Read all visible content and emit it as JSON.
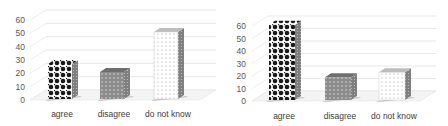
{
  "chart_data": [
    {
      "type": "bar",
      "style": "3d-column",
      "title": "",
      "xlabel": "",
      "ylabel": "",
      "categories": [
        "agree",
        "disagree",
        "do not know"
      ],
      "values": [
        27,
        21,
        51
      ],
      "ylim": [
        0,
        60
      ],
      "yticks": [
        0,
        10,
        20,
        30,
        40,
        50,
        60
      ],
      "grid": true,
      "legend": null,
      "fills": [
        "checker-diamond-black",
        "gray-dotted",
        "white-dotted"
      ]
    },
    {
      "type": "bar",
      "style": "3d-column",
      "title": "",
      "xlabel": "",
      "ylabel": "",
      "categories": [
        "agree",
        "disagree",
        "do not know"
      ],
      "values": [
        61,
        19,
        23
      ],
      "ylim": [
        0,
        60
      ],
      "yticks": [
        0,
        10,
        20,
        30,
        40,
        50,
        60
      ],
      "grid": true,
      "legend": null,
      "fills": [
        "checker-diamond-black",
        "gray-dotted",
        "white-dotted"
      ]
    }
  ],
  "colors": {
    "gridline": "#d9d9d9",
    "tick_text": "#595959",
    "bar_dark": "#1a1a1a",
    "bar_gray": "#8c8c8c",
    "bar_light": "#ffffff",
    "side_shade": "#7f7f7f"
  }
}
